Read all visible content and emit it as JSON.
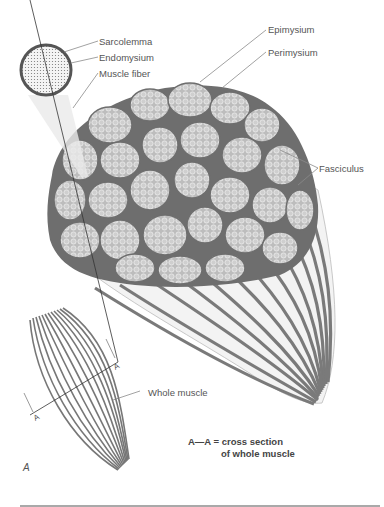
{
  "figure": {
    "panel_label": "A",
    "labels": {
      "sarcolemma": "Sarcolemma",
      "endomysium": "Endomysium",
      "muscle_fiber": "Muscle fiber",
      "epimysium": "Epimysium",
      "perimysium": "Perimysium",
      "fasciculus": "Fasciculus",
      "whole_muscle": "Whole muscle",
      "section_marker_top": "A",
      "section_marker_bottom": "A"
    },
    "caption": {
      "line1": "A—A = cross section",
      "line2": "of whole muscle"
    },
    "colors": {
      "sheath": "#6e6e6e",
      "fascicle_fill": "#bdbdbd",
      "fiber_outline": "#e6e6e6",
      "stripe": "#7a7a7a",
      "leader_line": "#8a8a8a"
    }
  }
}
